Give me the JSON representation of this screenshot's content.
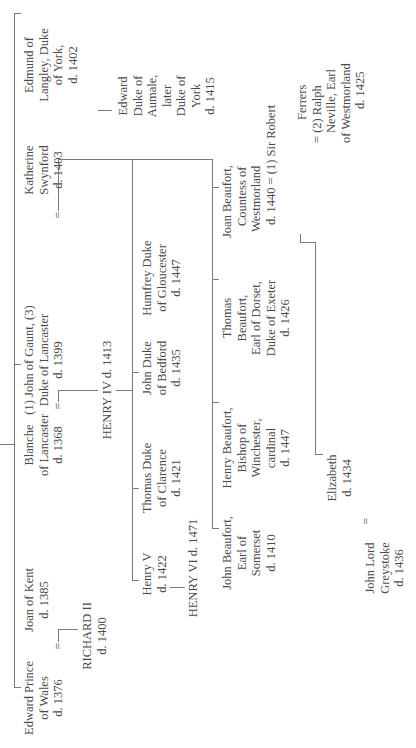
{
  "diagram": {
    "type": "family-tree",
    "orientation": "rotated-90-ccw",
    "line_color": "#7a7a7a",
    "text_color": "#4a4a4a",
    "marriage_symbol": "=",
    "generation1": {
      "edward_prince": [
        "Edward Prince",
        "of Wales",
        "d. 1376"
      ],
      "joan_of_kent": [
        "Joan of Kent",
        "d. 1385"
      ],
      "blanche": [
        "Blanche",
        "of Lancaster",
        "d. 1368"
      ],
      "john_of_gaunt": [
        "(1) John of Gaunt, (3)",
        "Duke of Lancaster",
        "d. 1399"
      ],
      "katherine": [
        "Katherine",
        "Swynford",
        "d. 1403"
      ],
      "edmund": [
        "Edmund of",
        "Langley, Duke",
        "of York,",
        "d. 1402"
      ]
    },
    "generation2": {
      "richard_ii": [
        "RICHARD II",
        "d. 1400"
      ],
      "henry_iv": "HENRY IV d. 1413",
      "edward_aumale": [
        "Edward",
        "Duke of",
        "Aumale,",
        "later",
        "Duke of",
        "York",
        "d. 1415"
      ],
      "john_beaufort": [
        "John Beaufort,",
        "Earl of",
        "Somerset",
        "d. 1410"
      ],
      "henry_beaufort": [
        "Henry Beaufort,",
        "Bishop of",
        "Winchester,",
        "cardinal",
        "d. 1447"
      ],
      "thomas_beaufort": [
        "Thomas",
        "Beaufort,",
        "Earl of Dorset,",
        "Duke of Exeter",
        "d. 1426"
      ],
      "joan_beaufort": [
        "Joan Beaufort,",
        "Countess of",
        "Westmorland",
        "d. 1440 = (1) Sir Robert"
      ],
      "joan_spouses": [
        "Ferrers",
        "= (2) Ralph",
        "Neville, Earl",
        "of Westmorland",
        "d. 1425"
      ]
    },
    "generation3": {
      "henry_v": [
        "Henry V",
        "d. 1422"
      ],
      "thomas_clarence": [
        "Thomas Duke",
        "of Clarence",
        "d. 1421"
      ],
      "john_bedford": [
        "John Duke",
        "of Bedford",
        "d. 1435"
      ],
      "humfrey_gloucester": [
        "Humfrey Duke",
        "of Gloucester",
        "d. 1447"
      ],
      "john_greystoke": [
        "John Lord",
        "Greystoke",
        "d. 1436"
      ],
      "elizabeth": [
        "Elizabeth",
        "d. 1434"
      ]
    },
    "generation4": {
      "henry_vi": "HENRY VI d. 1471"
    }
  }
}
